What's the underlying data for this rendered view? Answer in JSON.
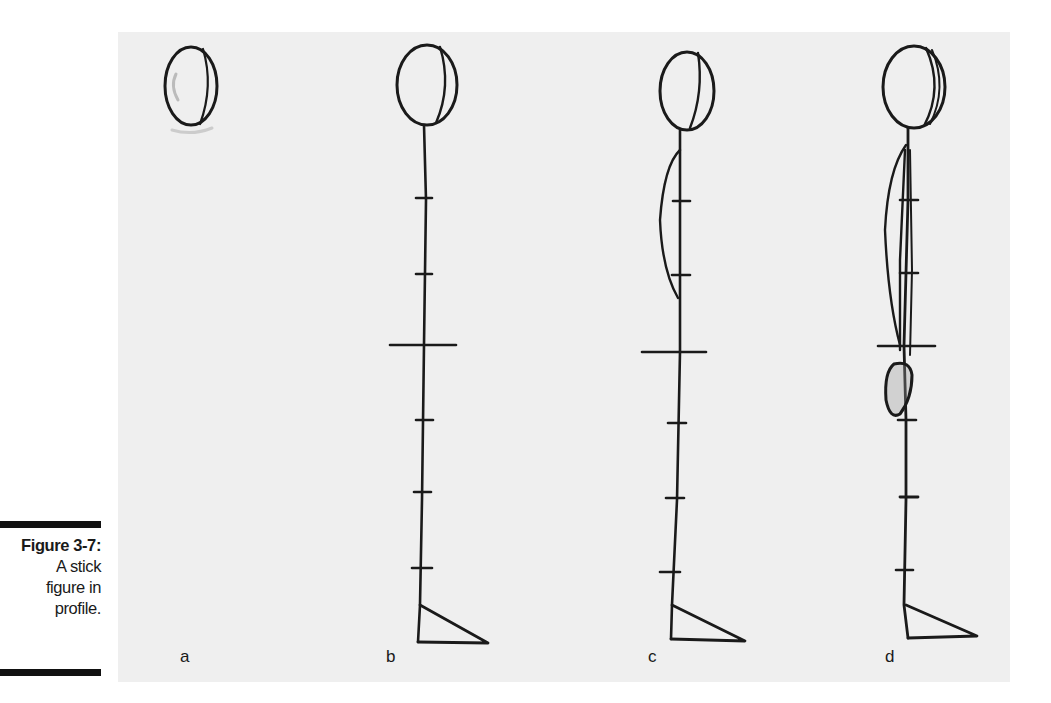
{
  "caption": {
    "title": "Figure 3-7:",
    "lines": [
      "A stick",
      "figure in",
      "profile."
    ]
  },
  "panels": [
    {
      "id": "a",
      "label": "a"
    },
    {
      "id": "b",
      "label": "b"
    },
    {
      "id": "c",
      "label": "c"
    },
    {
      "id": "d",
      "label": "d"
    }
  ],
  "colors": {
    "paper": "#efefef",
    "ink": "#1a1a1a",
    "caption_bar": "#111111"
  }
}
